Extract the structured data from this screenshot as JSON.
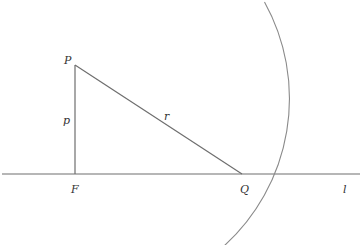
{
  "diagram": {
    "type": "geometry",
    "colors": {
      "stroke": "#6e6e6e",
      "text": "#333333",
      "background": "#ffffff"
    },
    "points": {
      "P": {
        "label": "P",
        "x": 75,
        "y": 65
      },
      "F": {
        "label": "F",
        "x": 75,
        "y": 174
      },
      "Q": {
        "label": "Q",
        "x": 242,
        "y": 174
      }
    },
    "segments": {
      "PF": {
        "label": "p"
      },
      "PQ": {
        "label": "r"
      }
    },
    "line": {
      "label": "l"
    },
    "arc": {
      "center": "P",
      "radius_label": "r",
      "radius_px": 199
    }
  }
}
